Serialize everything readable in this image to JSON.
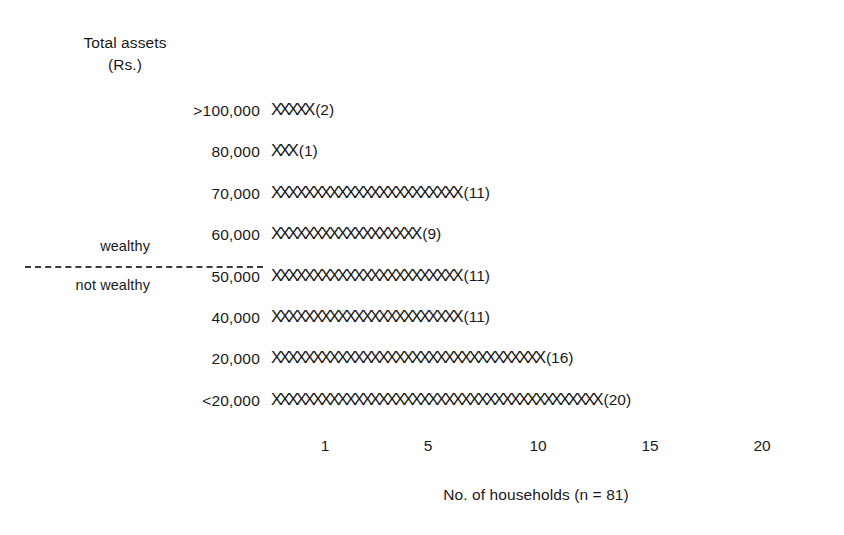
{
  "chart_data": {
    "type": "bar",
    "title": "",
    "ylabel_line1": "Total assets",
    "ylabel_line2": "(Rs.)",
    "xlabel": "No. of households (n = 81)",
    "categories": [
      ">100,000",
      "80,000",
      "70,000",
      "60,000",
      "50,000",
      "40,000",
      "20,000",
      "<20,000"
    ],
    "values": [
      2,
      1,
      11,
      9,
      11,
      11,
      16,
      20
    ],
    "marks": [
      "XXXXX",
      "XXX",
      "XXXXXXXXXXXXXXXXXXXXXXX",
      "XXXXXXXXXXXXXXXXXX",
      "XXXXXXXXXXXXXXXXXXXXXXX",
      "XXXXXXXXXXXXXXXXXXXXXXX",
      "XXXXXXXXXXXXXXXXXXXXXXXXXXXXXXXXX",
      "XXXXXXXXXXXXXXXXXXXXXXXXXXXXXXXXXXXXXXXX"
    ],
    "count_labels": [
      "(2)",
      "(1)",
      "(11)",
      "(9)",
      "(11)",
      "(11)",
      "(16)",
      "(20)"
    ],
    "xticks": [
      1,
      5,
      10,
      15,
      20
    ],
    "xtick_labels": [
      "1",
      "5",
      "10",
      "15",
      "20"
    ],
    "xtick_positions_px": [
      325,
      428,
      538,
      650,
      762
    ],
    "xlim": [
      0,
      21
    ],
    "grid": false,
    "legend": "none",
    "total_n": 81,
    "groups": [
      {
        "label": "wealthy",
        "categories": [
          ">100,000",
          "80,000",
          "70,000",
          "60,000"
        ],
        "subtotal": 23
      },
      {
        "label": "not wealthy",
        "categories": [
          "50,000",
          "40,000",
          "20,000",
          "<20,000"
        ],
        "subtotal": 58
      }
    ],
    "divider_note": "dashed line between 60,000 and 50,000 rows",
    "mark_glyph": "X",
    "colors": {
      "ink": "#1a1a1a",
      "background": "#ffffff",
      "divider": "#3a3a3a"
    }
  }
}
